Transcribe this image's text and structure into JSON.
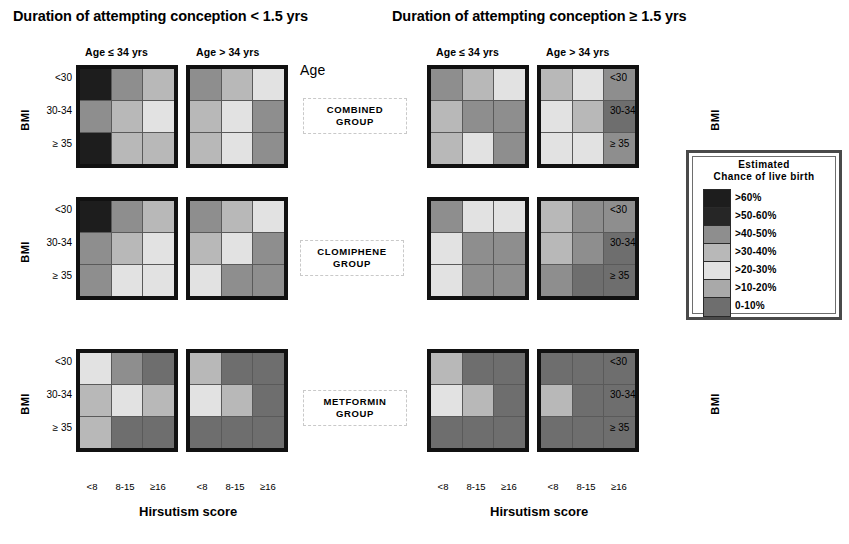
{
  "figure": {
    "duration_left": "Duration of attempting conception < 1.5 yrs",
    "duration_right": "Duration of attempting conception ≥ 1.5 yrs",
    "age_word": "Age",
    "age_headers": [
      "Age ≤ 34 yrs",
      "Age > 34 yrs",
      "Age ≤ 34 yrs",
      "Age > 34 yrs"
    ],
    "bmi_axis_label": "BMI",
    "bmi_ticks": [
      "<30",
      "30-34",
      "≥ 35"
    ],
    "x_title_left": "Hirsutism score",
    "x_title_right": "Hirsutism score",
    "x_ticks": [
      "<8",
      "8-15",
      "≥16"
    ],
    "groups": [
      {
        "line1": "COMBINED",
        "line2": "GROUP"
      },
      {
        "line1": "CLOMIPHENE",
        "line2": "GROUP"
      },
      {
        "line1": "METFORMIN",
        "line2": "GROUP"
      }
    ]
  },
  "legend": {
    "title_line1": "Estimated",
    "title_line2": "Chance of live birth",
    "entries": [
      {
        "label": ">60%",
        "color": "#1d1d1d"
      },
      {
        "label": ">50-60%",
        "color": "#262626"
      },
      {
        "label": ">40-50%",
        "color": "#8e8e8e"
      },
      {
        "label": ">30-40%",
        "color": "#b8b8b8"
      },
      {
        "label": ">20-30%",
        "color": "#e2e2e2"
      },
      {
        "label": ">10-20%",
        "color": "#a9a9a9"
      },
      {
        "label": "0-10%",
        "color": "#6e6e6e"
      }
    ]
  },
  "chart_data": {
    "type": "heatmap",
    "xlabel": "Hirsutism score",
    "ylabel": "BMI",
    "x_categories": [
      "<8",
      "8-15",
      "≥16"
    ],
    "y_categories": [
      "<30",
      "30-34",
      "≥ 35"
    ],
    "color_scale": [
      {
        "band": ">60%",
        "color": "#1d1d1d"
      },
      {
        "band": ">50-60%",
        "color": "#262626"
      },
      {
        "band": ">40-50%",
        "color": "#8e8e8e"
      },
      {
        "band": ">30-40%",
        "color": "#b8b8b8"
      },
      {
        "band": ">20-30%",
        "color": "#e2e2e2"
      },
      {
        "band": ">10-20%",
        "color": "#a9a9a9"
      },
      {
        "band": "0-10%",
        "color": "#6e6e6e"
      }
    ],
    "legend_position": "right",
    "panels": [
      {
        "id": "combined-short-young",
        "group": "COMBINED GROUP",
        "duration": "< 1.5 yrs",
        "age": "Age ≤ 34 yrs",
        "rows": [
          [
            ">60%",
            ">40-50%",
            ">30-40%"
          ],
          [
            ">40-50%",
            ">30-40%",
            ">20-30%"
          ],
          [
            ">60%",
            ">30-40%",
            ">30-40%"
          ]
        ]
      },
      {
        "id": "combined-short-old",
        "group": "COMBINED GROUP",
        "duration": "< 1.5 yrs",
        "age": "Age > 34 yrs",
        "rows": [
          [
            ">40-50%",
            ">30-40%",
            ">20-30%"
          ],
          [
            ">30-40%",
            ">20-30%",
            ">40-50%"
          ],
          [
            ">30-40%",
            ">20-30%",
            ">40-50%"
          ]
        ]
      },
      {
        "id": "combined-long-young",
        "group": "COMBINED GROUP",
        "duration": "≥ 1.5 yrs",
        "age": "Age ≤ 34 yrs",
        "rows": [
          [
            ">40-50%",
            ">30-40%",
            ">20-30%"
          ],
          [
            ">30-40%",
            ">40-50%",
            ">40-50%"
          ],
          [
            ">30-40%",
            ">20-30%",
            ">40-50%"
          ]
        ]
      },
      {
        "id": "combined-long-old",
        "group": "COMBINED GROUP",
        "duration": "≥ 1.5 yrs",
        "age": "Age > 34 yrs",
        "rows": [
          [
            ">30-40%",
            ">20-30%",
            ">40-50%"
          ],
          [
            ">20-30%",
            ">30-40%",
            "0-10%"
          ],
          [
            ">20-30%",
            ">20-30%",
            ">40-50%"
          ]
        ]
      },
      {
        "id": "clomiphene-short-young",
        "group": "CLOMIPHENE GROUP",
        "duration": "< 1.5 yrs",
        "age": "Age ≤ 34 yrs",
        "rows": [
          [
            ">60%",
            ">40-50%",
            ">30-40%"
          ],
          [
            ">40-50%",
            ">30-40%",
            ">20-30%"
          ],
          [
            ">40-50%",
            ">20-30%",
            ">20-30%"
          ]
        ]
      },
      {
        "id": "clomiphene-short-old",
        "group": "CLOMIPHENE GROUP",
        "duration": "< 1.5 yrs",
        "age": "Age > 34 yrs",
        "rows": [
          [
            ">40-50%",
            ">30-40%",
            ">20-30%"
          ],
          [
            ">30-40%",
            ">20-30%",
            ">40-50%"
          ],
          [
            ">20-30%",
            ">40-50%",
            ">40-50%"
          ]
        ]
      },
      {
        "id": "clomiphene-long-young",
        "group": "CLOMIPHENE GROUP",
        "duration": "≥ 1.5 yrs",
        "age": "Age ≤ 34 yrs",
        "rows": [
          [
            ">40-50%",
            ">20-30%",
            ">20-30%"
          ],
          [
            ">20-30%",
            ">40-50%",
            ">40-50%"
          ],
          [
            ">20-30%",
            ">40-50%",
            ">40-50%"
          ]
        ]
      },
      {
        "id": "clomiphene-long-old",
        "group": "CLOMIPHENE GROUP",
        "duration": "≥ 1.5 yrs",
        "age": "Age > 34 yrs",
        "rows": [
          [
            ">30-40%",
            ">40-50%",
            ">40-50%"
          ],
          [
            ">30-40%",
            ">40-50%",
            "0-10%"
          ],
          [
            ">40-50%",
            "0-10%",
            "0-10%"
          ]
        ]
      },
      {
        "id": "metformin-short-young",
        "group": "METFORMIN GROUP",
        "duration": "< 1.5 yrs",
        "age": "Age ≤ 34 yrs",
        "rows": [
          [
            ">20-30%",
            ">40-50%",
            "0-10%"
          ],
          [
            ">30-40%",
            ">20-30%",
            ">30-40%"
          ],
          [
            ">30-40%",
            "0-10%",
            "0-10%"
          ]
        ]
      },
      {
        "id": "metformin-short-old",
        "group": "METFORMIN GROUP",
        "duration": "< 1.5 yrs",
        "age": "Age > 34 yrs",
        "rows": [
          [
            ">30-40%",
            "0-10%",
            "0-10%"
          ],
          [
            ">20-30%",
            ">30-40%",
            "0-10%"
          ],
          [
            "0-10%",
            "0-10%",
            "0-10%"
          ]
        ]
      },
      {
        "id": "metformin-long-young",
        "group": "METFORMIN GROUP",
        "duration": "≥ 1.5 yrs",
        "age": "Age ≤ 34 yrs",
        "rows": [
          [
            ">30-40%",
            "0-10%",
            "0-10%"
          ],
          [
            ">20-30%",
            ">30-40%",
            "0-10%"
          ],
          [
            "0-10%",
            "0-10%",
            "0-10%"
          ]
        ]
      },
      {
        "id": "metformin-long-old",
        "group": "METFORMIN GROUP",
        "duration": "≥ 1.5 yrs",
        "age": "Age > 34 yrs",
        "rows": [
          [
            "0-10%",
            "0-10%",
            "0-10%"
          ],
          [
            ">30-40%",
            "0-10%",
            "0-10%"
          ],
          [
            "0-10%",
            "0-10%",
            "0-10%"
          ]
        ]
      }
    ]
  },
  "layout": {
    "panel_positions": [
      {
        "left": 76,
        "top": 65
      },
      {
        "left": 186,
        "top": 65
      },
      {
        "left": 427,
        "top": 65
      },
      {
        "left": 537,
        "top": 65
      },
      {
        "left": 76,
        "top": 197
      },
      {
        "left": 186,
        "top": 197
      },
      {
        "left": 427,
        "top": 197
      },
      {
        "left": 537,
        "top": 197
      },
      {
        "left": 76,
        "top": 349
      },
      {
        "left": 186,
        "top": 349
      },
      {
        "left": 427,
        "top": 349
      },
      {
        "left": 537,
        "top": 349
      }
    ],
    "age_header_positions": [
      {
        "left": 85,
        "top": 46
      },
      {
        "left": 196,
        "top": 46
      },
      {
        "left": 436,
        "top": 46
      },
      {
        "left": 546,
        "top": 46
      }
    ],
    "group_box_positions": [
      {
        "left": 303,
        "top": 98
      },
      {
        "left": 300,
        "top": 240
      },
      {
        "left": 303,
        "top": 390
      }
    ],
    "bmi_axis_positions": [
      {
        "left": 14,
        "top": 114,
        "side": "left"
      },
      {
        "left": 14,
        "top": 246,
        "side": "left"
      },
      {
        "left": 14,
        "top": 398,
        "side": "left"
      },
      {
        "left": 652,
        "top": 114,
        "side": "right"
      },
      {
        "left": 652,
        "top": 246,
        "side": "right"
      },
      {
        "left": 652,
        "top": 398,
        "side": "right"
      }
    ]
  }
}
